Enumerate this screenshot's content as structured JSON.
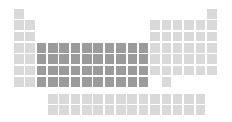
{
  "figure": {
    "type": "periodic-table-diagram",
    "width": 232,
    "height": 122,
    "background_color": "#ffffff"
  },
  "legend": {
    "normal_label": "Other elements",
    "normal_color": "#d9d9d9",
    "highlight_label": "Transition metals (d-block)",
    "highlight_color": "#9b9b9b"
  },
  "layout": {
    "main_origin_x": 14,
    "main_origin_y": 9,
    "f_origin_x": 48,
    "f_origin_y": 94,
    "col_pitch": 11.35,
    "row_pitch": 11.35,
    "cell_size": 9.6,
    "main_columns": 18,
    "main_rows": 7,
    "f_columns": 14,
    "f_rows": 2
  },
  "chart_data": {
    "type": "heatmap",
    "xlabel": "Group",
    "ylabel": "Period",
    "categories_x": [
      "1",
      "2",
      "3",
      "4",
      "5",
      "6",
      "7",
      "8",
      "9",
      "10",
      "11",
      "12",
      "13",
      "14",
      "15",
      "16",
      "17",
      "18"
    ],
    "categories_y": [
      "1",
      "2",
      "3",
      "4",
      "5",
      "6",
      "7"
    ],
    "legend": [
      "Other elements",
      "Transition metals (d-block)"
    ],
    "main_cells": [
      {
        "row": 1,
        "col": 1,
        "state": "normal"
      },
      {
        "row": 1,
        "col": 18,
        "state": "normal"
      },
      {
        "row": 2,
        "col": 1,
        "state": "normal"
      },
      {
        "row": 2,
        "col": 2,
        "state": "normal"
      },
      {
        "row": 2,
        "col": 13,
        "state": "normal"
      },
      {
        "row": 2,
        "col": 14,
        "state": "normal"
      },
      {
        "row": 2,
        "col": 15,
        "state": "normal"
      },
      {
        "row": 2,
        "col": 16,
        "state": "normal"
      },
      {
        "row": 2,
        "col": 17,
        "state": "normal"
      },
      {
        "row": 2,
        "col": 18,
        "state": "normal"
      },
      {
        "row": 3,
        "col": 1,
        "state": "normal"
      },
      {
        "row": 3,
        "col": 2,
        "state": "normal"
      },
      {
        "row": 3,
        "col": 13,
        "state": "normal"
      },
      {
        "row": 3,
        "col": 14,
        "state": "normal"
      },
      {
        "row": 3,
        "col": 15,
        "state": "normal"
      },
      {
        "row": 3,
        "col": 16,
        "state": "normal"
      },
      {
        "row": 3,
        "col": 17,
        "state": "normal"
      },
      {
        "row": 3,
        "col": 18,
        "state": "normal"
      },
      {
        "row": 4,
        "col": 1,
        "state": "normal"
      },
      {
        "row": 4,
        "col": 2,
        "state": "normal"
      },
      {
        "row": 4,
        "col": 3,
        "state": "highlight"
      },
      {
        "row": 4,
        "col": 4,
        "state": "highlight"
      },
      {
        "row": 4,
        "col": 5,
        "state": "highlight"
      },
      {
        "row": 4,
        "col": 6,
        "state": "highlight"
      },
      {
        "row": 4,
        "col": 7,
        "state": "highlight"
      },
      {
        "row": 4,
        "col": 8,
        "state": "highlight"
      },
      {
        "row": 4,
        "col": 9,
        "state": "highlight"
      },
      {
        "row": 4,
        "col": 10,
        "state": "highlight"
      },
      {
        "row": 4,
        "col": 11,
        "state": "highlight"
      },
      {
        "row": 4,
        "col": 12,
        "state": "highlight"
      },
      {
        "row": 4,
        "col": 13,
        "state": "normal"
      },
      {
        "row": 4,
        "col": 14,
        "state": "normal"
      },
      {
        "row": 4,
        "col": 15,
        "state": "normal"
      },
      {
        "row": 4,
        "col": 16,
        "state": "normal"
      },
      {
        "row": 4,
        "col": 17,
        "state": "normal"
      },
      {
        "row": 4,
        "col": 18,
        "state": "normal"
      },
      {
        "row": 5,
        "col": 1,
        "state": "normal"
      },
      {
        "row": 5,
        "col": 2,
        "state": "normal"
      },
      {
        "row": 5,
        "col": 3,
        "state": "highlight"
      },
      {
        "row": 5,
        "col": 4,
        "state": "highlight"
      },
      {
        "row": 5,
        "col": 5,
        "state": "highlight"
      },
      {
        "row": 5,
        "col": 6,
        "state": "highlight"
      },
      {
        "row": 5,
        "col": 7,
        "state": "highlight"
      },
      {
        "row": 5,
        "col": 8,
        "state": "highlight"
      },
      {
        "row": 5,
        "col": 9,
        "state": "highlight"
      },
      {
        "row": 5,
        "col": 10,
        "state": "highlight"
      },
      {
        "row": 5,
        "col": 11,
        "state": "highlight"
      },
      {
        "row": 5,
        "col": 12,
        "state": "highlight"
      },
      {
        "row": 5,
        "col": 13,
        "state": "normal"
      },
      {
        "row": 5,
        "col": 14,
        "state": "normal"
      },
      {
        "row": 5,
        "col": 15,
        "state": "normal"
      },
      {
        "row": 5,
        "col": 16,
        "state": "normal"
      },
      {
        "row": 5,
        "col": 17,
        "state": "normal"
      },
      {
        "row": 5,
        "col": 18,
        "state": "normal"
      },
      {
        "row": 6,
        "col": 1,
        "state": "normal"
      },
      {
        "row": 6,
        "col": 2,
        "state": "normal"
      },
      {
        "row": 6,
        "col": 3,
        "state": "highlight"
      },
      {
        "row": 6,
        "col": 4,
        "state": "highlight"
      },
      {
        "row": 6,
        "col": 5,
        "state": "highlight"
      },
      {
        "row": 6,
        "col": 6,
        "state": "highlight"
      },
      {
        "row": 6,
        "col": 7,
        "state": "highlight"
      },
      {
        "row": 6,
        "col": 8,
        "state": "highlight"
      },
      {
        "row": 6,
        "col": 9,
        "state": "highlight"
      },
      {
        "row": 6,
        "col": 10,
        "state": "highlight"
      },
      {
        "row": 6,
        "col": 11,
        "state": "highlight"
      },
      {
        "row": 6,
        "col": 12,
        "state": "highlight"
      },
      {
        "row": 6,
        "col": 13,
        "state": "normal"
      },
      {
        "row": 6,
        "col": 14,
        "state": "normal"
      },
      {
        "row": 6,
        "col": 15,
        "state": "normal"
      },
      {
        "row": 6,
        "col": 16,
        "state": "normal"
      },
      {
        "row": 6,
        "col": 17,
        "state": "normal"
      },
      {
        "row": 6,
        "col": 18,
        "state": "normal"
      },
      {
        "row": 7,
        "col": 1,
        "state": "normal"
      },
      {
        "row": 7,
        "col": 2,
        "state": "normal"
      },
      {
        "row": 7,
        "col": 3,
        "state": "highlight"
      },
      {
        "row": 7,
        "col": 4,
        "state": "highlight"
      },
      {
        "row": 7,
        "col": 5,
        "state": "highlight"
      },
      {
        "row": 7,
        "col": 6,
        "state": "highlight"
      },
      {
        "row": 7,
        "col": 7,
        "state": "highlight"
      },
      {
        "row": 7,
        "col": 8,
        "state": "highlight"
      },
      {
        "row": 7,
        "col": 9,
        "state": "highlight"
      },
      {
        "row": 7,
        "col": 10,
        "state": "highlight"
      },
      {
        "row": 7,
        "col": 11,
        "state": "highlight"
      },
      {
        "row": 7,
        "col": 12,
        "state": "highlight"
      },
      {
        "row": 7,
        "col": 14,
        "state": "normal"
      }
    ],
    "f_block_cells": [
      {
        "row": 1,
        "col": 1,
        "state": "normal"
      },
      {
        "row": 1,
        "col": 2,
        "state": "normal"
      },
      {
        "row": 1,
        "col": 3,
        "state": "normal"
      },
      {
        "row": 1,
        "col": 4,
        "state": "normal"
      },
      {
        "row": 1,
        "col": 5,
        "state": "normal"
      },
      {
        "row": 1,
        "col": 6,
        "state": "normal"
      },
      {
        "row": 1,
        "col": 7,
        "state": "normal"
      },
      {
        "row": 1,
        "col": 8,
        "state": "normal"
      },
      {
        "row": 1,
        "col": 9,
        "state": "normal"
      },
      {
        "row": 1,
        "col": 10,
        "state": "normal"
      },
      {
        "row": 1,
        "col": 11,
        "state": "normal"
      },
      {
        "row": 1,
        "col": 12,
        "state": "normal"
      },
      {
        "row": 1,
        "col": 13,
        "state": "normal"
      },
      {
        "row": 1,
        "col": 14,
        "state": "normal"
      },
      {
        "row": 2,
        "col": 1,
        "state": "normal"
      },
      {
        "row": 2,
        "col": 2,
        "state": "normal"
      },
      {
        "row": 2,
        "col": 3,
        "state": "normal"
      },
      {
        "row": 2,
        "col": 4,
        "state": "normal"
      },
      {
        "row": 2,
        "col": 5,
        "state": "normal"
      },
      {
        "row": 2,
        "col": 6,
        "state": "normal"
      },
      {
        "row": 2,
        "col": 7,
        "state": "normal"
      },
      {
        "row": 2,
        "col": 8,
        "state": "normal"
      },
      {
        "row": 2,
        "col": 9,
        "state": "normal"
      },
      {
        "row": 2,
        "col": 10,
        "state": "normal"
      },
      {
        "row": 2,
        "col": 11,
        "state": "normal"
      },
      {
        "row": 2,
        "col": 12,
        "state": "normal"
      },
      {
        "row": 2,
        "col": 13,
        "state": "normal"
      },
      {
        "row": 2,
        "col": 14,
        "state": "normal"
      }
    ]
  }
}
